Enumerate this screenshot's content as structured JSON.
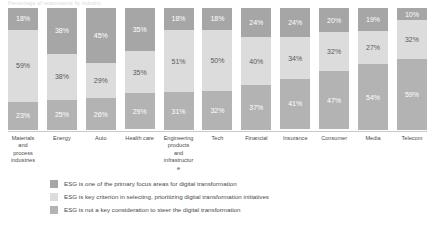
{
  "title_strip": "Percentage of respondents by industry",
  "chart_data": {
    "type": "bar",
    "title": "",
    "subtitle": "",
    "xlabel": "",
    "ylabel": "",
    "ylim": [
      0,
      100
    ],
    "grid": false,
    "stacked": true,
    "stack_mode": "percent",
    "legend_position": "bottom",
    "categories": [
      "Materials and process industries",
      "Energy",
      "Auto",
      "Health care",
      "Engineering products and infrastructure",
      "Tech",
      "Financial",
      "Insurance",
      "Consumer",
      "Media",
      "Telecom"
    ],
    "series": [
      {
        "name": "ESG is one of the primary focus areas for digital transformation",
        "color": "#a6a6a6",
        "values": [
          18,
          38,
          45,
          35,
          18,
          18,
          24,
          24,
          20,
          19,
          10
        ],
        "labels": [
          "18%",
          "38%",
          "45%",
          "35%",
          "18%",
          "18%",
          "24%",
          "24%",
          "20%",
          "19%",
          "10%"
        ]
      },
      {
        "name": "ESG is key criterion in selecting, prioritizing digital transformation initiatives",
        "color": "#dcdcdc",
        "values": [
          59,
          38,
          29,
          35,
          51,
          50,
          40,
          34,
          32,
          27,
          32
        ],
        "labels": [
          "59%",
          "38%",
          "29%",
          "35%",
          "51%",
          "50%",
          "40%",
          "34%",
          "32%",
          "27%",
          "32%"
        ]
      },
      {
        "name": "ESG is not a key consideration to steer the digital transformation",
        "color": "#b3b3b3",
        "values": [
          23,
          25,
          26,
          29,
          31,
          32,
          37,
          41,
          47,
          54,
          59
        ],
        "labels": [
          "23%",
          "25%",
          "26%",
          "29%",
          "31%",
          "32%",
          "37%",
          "41%",
          "47%",
          "54%",
          "59%"
        ]
      }
    ]
  },
  "legend": {
    "items": [
      {
        "label": "ESG is one of the primary focus areas for digital transformation",
        "color": "#a6a6a6"
      },
      {
        "label": "ESG is key criterion in selecting, prioritizing digital transformation initiatives",
        "color": "#dcdcdc"
      },
      {
        "label": "ESG is not a key consideration to steer the digital transformation",
        "color": "#b3b3b3"
      }
    ]
  }
}
